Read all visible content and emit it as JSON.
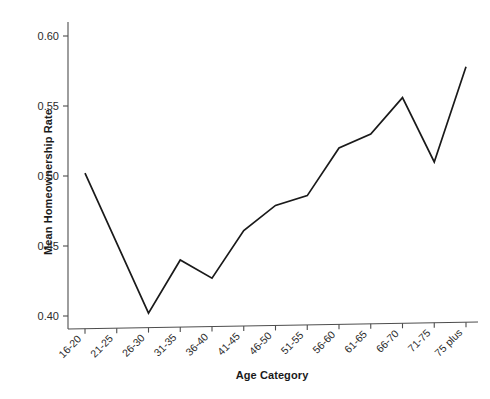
{
  "chart_data": {
    "type": "line",
    "title": "",
    "xlabel": "Age Category",
    "ylabel": "Mean Homeownership Rate",
    "categories": [
      "16-20",
      "21-25",
      "26-30",
      "31-35",
      "36-40",
      "41-45",
      "46-50",
      "51-55",
      "56-60",
      "61-65",
      "66-70",
      "71-75",
      "75 plus"
    ],
    "values": [
      0.502,
      0.452,
      0.402,
      0.44,
      0.427,
      0.461,
      0.479,
      0.486,
      0.52,
      0.53,
      0.556,
      0.51,
      0.578
    ],
    "series": [
      {
        "name": "Mean Homeownership Rate",
        "values": [
          0.502,
          0.452,
          0.402,
          0.44,
          0.427,
          0.461,
          0.479,
          0.486,
          0.52,
          0.53,
          0.556,
          0.51,
          0.578
        ]
      }
    ],
    "ylim": [
      0.39,
      0.605
    ],
    "ytick_labels": [
      "0.40",
      "0.45",
      "0.50",
      "0.55",
      "0.60"
    ],
    "ytick_values": [
      0.4,
      0.45,
      0.5,
      0.55,
      0.6
    ],
    "xtick_labels": [
      "16-20",
      "21-25",
      "26-30",
      "31-35",
      "36-40",
      "41-45",
      "46-50",
      "51-55",
      "56-60",
      "61-65",
      "66-70",
      "71-75",
      "75 plus"
    ],
    "grid": false,
    "legend": null,
    "legend_position": "none",
    "line_color": "#1a1a1a",
    "axis_color": "#4d4d4d",
    "background_color": "#ffffff",
    "markers": false,
    "xtick_label_rotation": -45
  }
}
